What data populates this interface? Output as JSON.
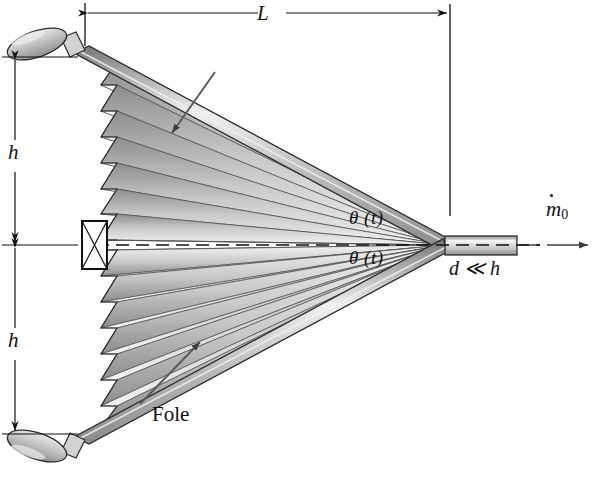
{
  "figure": {
    "type": "engineering-schematic",
    "background_color": "#ffffff",
    "ink_color": "#111111"
  },
  "labels": {
    "length_L": "L",
    "height_top": "h",
    "height_bottom": "h",
    "theta_upper": "θ (t)",
    "theta_lower": "θ (t)",
    "gap_condition": "d ≪ h",
    "bellows_callout": "Fole",
    "mass_flow_symbol": "m",
    "mass_flow_subscript": "0"
  },
  "dimensions": {
    "overall_length_label": "L",
    "half_height_label": "h",
    "nozzle_width_label": "d",
    "nozzle_relation": "d ≪ h"
  },
  "annotations": [
    {
      "name": "length-dimension",
      "text": "L",
      "orientation": "horizontal",
      "arrowheads": "both"
    },
    {
      "name": "height-dimension-upper",
      "text": "h",
      "orientation": "vertical",
      "arrowheads": "both"
    },
    {
      "name": "height-dimension-lower",
      "text": "h",
      "orientation": "vertical",
      "arrowheads": "both"
    },
    {
      "name": "angle-label-upper",
      "text": "θ (t)"
    },
    {
      "name": "angle-label-lower",
      "text": "θ (t)"
    },
    {
      "name": "nozzle-gap-note",
      "text": "d ≪ h"
    },
    {
      "name": "bellows-callout",
      "text": "Fole",
      "has_leader_arrow": true
    },
    {
      "name": "mass-flow-arrow",
      "text": "ṁ₀",
      "direction": "right"
    }
  ],
  "geometry": {
    "pleat_count_upper": 7,
    "pleat_count_lower": 7,
    "apex_x": 445,
    "centerline_y": 245,
    "nozzle_x_start": 445,
    "nozzle_x_end": 517
  },
  "colors": {
    "outline": "#111111",
    "pleat_dark": "#8a8a8a",
    "pleat_light": "#f2f2f2",
    "rod_body": "#b9b9b9",
    "rod_highlight": "#eeeeee",
    "knob_fill": "#c3c3c3"
  }
}
